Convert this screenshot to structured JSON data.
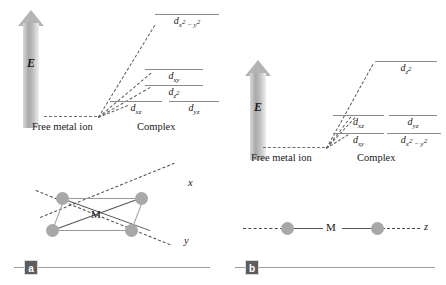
{
  "figure": {
    "panels": [
      {
        "badge": "a",
        "energy_axis_label": "E",
        "free_ion_label": "Free metal ion",
        "complex_label": "Complex",
        "geometry": "square-planar",
        "geometry_center_label": "M",
        "geometry_axis_labels": [
          "x",
          "y"
        ],
        "levels": [
          {
            "name": "dx2-y2",
            "label_html": "d<sub>x<sup>2</sup> − y<sup>2</sup></sub>",
            "energy": 1.0,
            "column": "wide"
          },
          {
            "name": "dxy",
            "label_html": "d<sub>xy</sub>",
            "energy": 0.46,
            "column": "wide"
          },
          {
            "name": "dz2",
            "label_html": "d<sub>z<sup>2</sup></sub>",
            "energy": 0.345,
            "column": "wide"
          },
          {
            "name": "dxz",
            "label_html": "d<sub>xz</sub>",
            "energy": 0.235,
            "column": "left"
          },
          {
            "name": "dyz",
            "label_html": "d<sub>yz</sub>",
            "energy": 0.235,
            "column": "right"
          }
        ]
      },
      {
        "badge": "b",
        "energy_axis_label": "E",
        "free_ion_label": "Free metal ion",
        "complex_label": "Complex",
        "geometry": "linear",
        "geometry_center_label": "M",
        "geometry_axis_labels": [
          "z"
        ],
        "levels": [
          {
            "name": "dz2",
            "label_html": "d<sub>z<sup>2</sup></sub>",
            "energy": 1.0,
            "column": "wide"
          },
          {
            "name": "dxz",
            "label_html": "d<sub>xz</sub>",
            "energy": 0.4,
            "column": "left"
          },
          {
            "name": "dyz",
            "label_html": "d<sub>yz</sub>",
            "energy": 0.4,
            "column": "right"
          },
          {
            "name": "dxy",
            "label_html": "d<sub>xy</sub>",
            "energy": 0.16,
            "column": "left"
          },
          {
            "name": "dx2-y2",
            "label_html": "d<sub>x<sup>2</sup> − y<sup>2</sup></sub>",
            "energy": 0.16,
            "column": "right"
          }
        ]
      }
    ]
  }
}
